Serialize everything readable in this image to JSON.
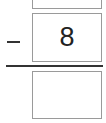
{
  "problem": {
    "operator": "minus",
    "top_value": "",
    "subtrahend": "8",
    "answer_value": ""
  }
}
